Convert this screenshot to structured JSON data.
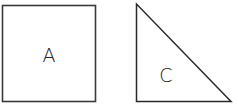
{
  "shapes": {
    "square": {
      "label": "A",
      "stroke": "#3a3a3a"
    },
    "triangle": {
      "label": "C",
      "stroke": "#2a2a2a"
    }
  }
}
